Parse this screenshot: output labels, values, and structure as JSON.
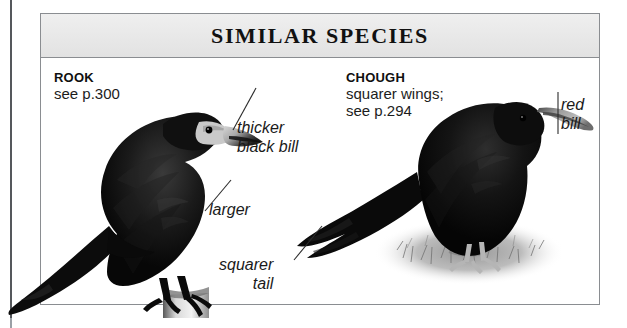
{
  "panel": {
    "title": "SIMILAR SPECIES"
  },
  "species": [
    {
      "id": "rook",
      "name": "ROOK",
      "reference": "see p.300"
    },
    {
      "id": "chough",
      "name": "CHOUGH",
      "reference": "squarer wings;\nsee p.294"
    }
  ],
  "callouts": [
    {
      "id": "thicker-black-bill",
      "text": "thicker\nblack bill",
      "target": "rook bill"
    },
    {
      "id": "larger",
      "text": "larger",
      "target": "rook body"
    },
    {
      "id": "squarer-tail",
      "text": "squarer\ntail",
      "target": "chough tail"
    },
    {
      "id": "red-bill",
      "text": "red\nbill",
      "target": "chough bill"
    }
  ],
  "colors": {
    "panel_border": "#8a8d91",
    "header_fill": "#e8e8e8",
    "title_text": "#111111",
    "body_text": "#1a1a1a",
    "bird_black": "#0d0d0d",
    "bill_pale": "#b9b9b9",
    "ground": "#9b9b9b"
  }
}
